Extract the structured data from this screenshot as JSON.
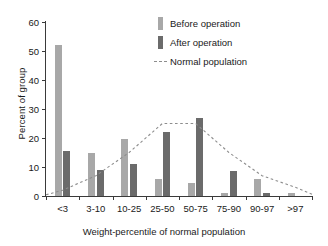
{
  "chart_data": {
    "type": "bar",
    "title": "",
    "xlabel": "Weight-percentile of normal population",
    "ylabel": "Percent of group",
    "categories": [
      "<3",
      "3-10",
      "10-25",
      "25-50",
      "50-75",
      "75-90",
      "90-97",
      ">97"
    ],
    "ylim": [
      0,
      60
    ],
    "yticks": [
      0,
      10,
      20,
      30,
      40,
      50,
      60
    ],
    "grid": false,
    "legend_position": "top-right",
    "series": [
      {
        "name": "Before operation",
        "type": "bar",
        "color": "#a8a8a8",
        "values": [
          52,
          15,
          19.5,
          6,
          4.5,
          1,
          6,
          1
        ]
      },
      {
        "name": "After operation",
        "type": "bar",
        "color": "#6b6b6b",
        "values": [
          15.5,
          9,
          11,
          22,
          27,
          8.5,
          1,
          0
        ]
      },
      {
        "name": "Normal population",
        "type": "line",
        "style": "dashed",
        "color": "#8d8d8d",
        "values": [
          2,
          7,
          15,
          25,
          25,
          15,
          7,
          3
        ]
      }
    ]
  },
  "legend": {
    "items": [
      {
        "label": "Before operation",
        "marker": "swatch-light-gray"
      },
      {
        "label": "After operation",
        "marker": "swatch-dark-gray"
      },
      {
        "label": "Normal population",
        "marker": "dashed-line"
      }
    ]
  }
}
